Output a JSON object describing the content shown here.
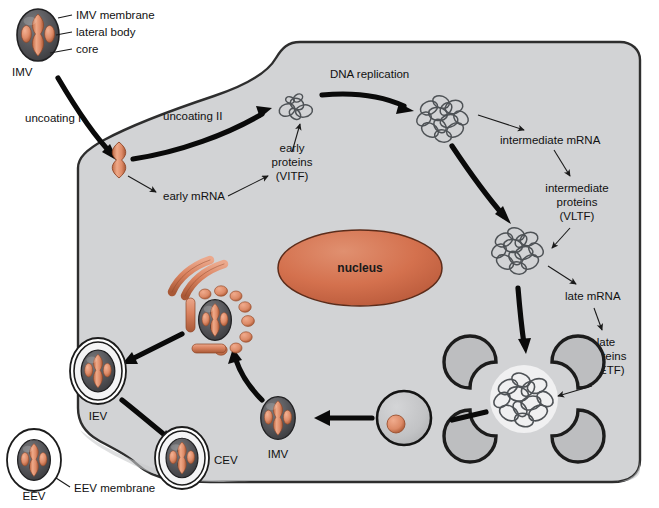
{
  "figure": {
    "colors": {
      "cytoplasm": "#d2d3d5",
      "cell_outline": "#2b2b2b",
      "background": "#ffffff",
      "nucleus_fill": "#d9714f",
      "nucleus_outline": "#5a2a18",
      "virion_membrane": "#4a4a4c",
      "core_salmon": "#e08a6a",
      "core_salmon_dark": "#b85a38",
      "golgi": "#d98567",
      "crescent_fill": "#bdbec0",
      "crescent_stroke": "#1c1c1c",
      "dna_stroke": "#4e5256",
      "arrow_black": "#0a0a0a",
      "thin_arrow": "#1a1a1a"
    }
  },
  "labels": {
    "imv_membrane": "IMV membrane",
    "lateral_body": "lateral body",
    "core": "core",
    "imv_top": "IMV",
    "uncoating_1": "uncoating I",
    "uncoating_2": "uncoating II",
    "early_mrna": "early mRNA",
    "early_proteins_line1": "early",
    "early_proteins_line2": "proteins",
    "early_proteins_line3": "(VITF)",
    "dna_replication": "DNA replication",
    "intermediate_mrna": "intermediate mRNA",
    "intermediate_proteins_line1": "intermediate",
    "intermediate_proteins_line2": "proteins",
    "intermediate_proteins_line3": "(VLTF)",
    "late_mrna": "late mRNA",
    "late_proteins_line1": "late",
    "late_proteins_line2": "proteins",
    "late_proteins_line3": "(VETF)",
    "nucleus": "nucleus",
    "imv_bottom": "IMV",
    "iev": "IEV",
    "cev": "CEV",
    "eev": "EEV",
    "eev_membrane": "EEV membrane"
  },
  "structures": {
    "imv_top": {
      "name": "IMV virion",
      "x": 38,
      "y": 35
    },
    "uncoated_core": {
      "name": "uncoated core",
      "x": 119,
      "y": 160
    },
    "early_dna": {
      "name": "early transcription template",
      "x": 296,
      "y": 108
    },
    "replication_factory_1": {
      "name": "DNA replication factory",
      "x": 440,
      "y": 115
    },
    "replication_factory_2": {
      "name": "intermediate factory",
      "x": 516,
      "y": 248
    },
    "replication_factory_3": {
      "name": "late factory with crescents",
      "x": 524,
      "y": 390
    },
    "nucleus": {
      "name": "nucleus",
      "cx": 360,
      "cy": 268,
      "rx": 82,
      "ry": 38
    },
    "immature_virion": {
      "name": "immature virion",
      "x": 404,
      "y": 418
    },
    "imv_bottom": {
      "name": "mature IMV",
      "x": 278,
      "y": 418
    },
    "golgi_wrapping": {
      "name": "Golgi wrapping site",
      "x": 215,
      "y": 320
    },
    "iev": {
      "name": "IEV double-wrapped virion",
      "x": 98,
      "y": 371
    },
    "cev": {
      "name": "CEV cell-associated virion",
      "x": 182,
      "y": 458
    },
    "eev": {
      "name": "EEV extracellular virion",
      "x": 34,
      "y": 460
    }
  },
  "flow_steps": [
    "IMV binds and enters cell",
    "uncoating I releases core",
    "early mRNA and early proteins (VITF)",
    "uncoating II exposes genome",
    "DNA replication in cytoplasmic factory",
    "intermediate mRNA and intermediate proteins (VLTF)",
    "late mRNA and late proteins (VETF)",
    "crescent membranes form immature virion",
    "immature virion matures to IMV",
    "Golgi wrapping gives IEV",
    "IEV fuses with plasma membrane to give CEV",
    "CEV released as EEV"
  ]
}
